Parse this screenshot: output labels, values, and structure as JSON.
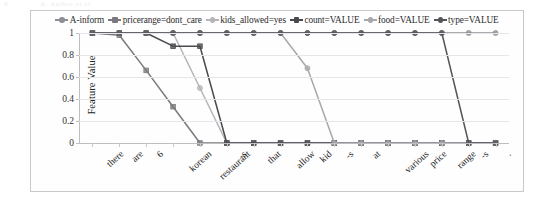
{
  "page_artifact": {
    "page_number": "6",
    "running_head": "A. Author et al."
  },
  "chart_data": {
    "type": "line",
    "title": "",
    "xlabel": "",
    "ylabel": "Feature Value",
    "ylim": [
      0,
      1
    ],
    "yticks": [
      "0",
      "0.2",
      "0.4",
      "0.6",
      "0.8",
      "1"
    ],
    "grid": true,
    "legend_position": "top-center",
    "categories": [
      "there",
      "are",
      "6",
      "korean",
      "restaurant",
      "-s",
      "that",
      "allow",
      "kid",
      "-s",
      "at",
      "various",
      "price",
      "range",
      "-s",
      "."
    ],
    "series": [
      {
        "name": "A-inform",
        "color": "#8f8f93",
        "marker": "circle",
        "values": [
          1,
          1,
          1,
          1,
          1,
          1,
          1,
          1,
          1,
          1,
          1,
          1,
          1,
          1,
          1,
          1
        ]
      },
      {
        "name": "pricerange=dont_care",
        "color": "#7a7a7e",
        "marker": "square",
        "values": [
          1,
          0.98,
          0.66,
          0.33,
          0,
          0,
          0,
          0,
          0,
          0,
          0,
          0,
          0,
          0,
          0,
          0
        ]
      },
      {
        "name": "kids_allowed=yes",
        "color": "#b5b5b9",
        "marker": "circle",
        "values": [
          1,
          1,
          1,
          1,
          0.5,
          0,
          0,
          0,
          0,
          0,
          0,
          0,
          0,
          0,
          0,
          0
        ]
      },
      {
        "name": "count=VALUE",
        "color": "#4a4a4e",
        "marker": "square",
        "values": [
          1,
          1,
          1,
          0.88,
          0.88,
          0,
          0,
          0,
          0,
          0,
          0,
          0,
          0,
          0,
          0,
          0
        ]
      },
      {
        "name": "food=VALUE",
        "color": "#a8a8ac",
        "marker": "circle",
        "values": [
          1,
          1,
          1,
          1,
          1,
          1,
          1,
          1,
          0.68,
          0,
          0,
          0,
          0,
          0,
          0,
          0
        ]
      },
      {
        "name": "type=VALUE",
        "color": "#555559",
        "marker": "circle",
        "values": [
          1,
          1,
          1,
          1,
          1,
          1,
          1,
          1,
          1,
          1,
          1,
          1,
          1,
          1,
          0,
          0
        ]
      }
    ]
  }
}
